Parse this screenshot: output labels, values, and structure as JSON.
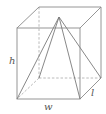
{
  "figure": {
    "labels": {
      "height": "h",
      "width": "w",
      "length": "l"
    },
    "colors": {
      "edge": "#8a8a8a",
      "hidden_edge": "#a8a8a8",
      "label": "#555555",
      "background": "#ffffff"
    }
  }
}
